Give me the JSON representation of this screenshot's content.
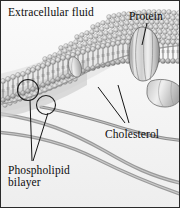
{
  "figure": {
    "background_color": "#fdfdfd",
    "border_color": "#2a2a2a",
    "width": 180,
    "height": 208
  },
  "labels": {
    "extracellular_fluid": "Extracellular fluid",
    "protein": "Protein",
    "cholesterol": "Cholesterol",
    "phospholipid_line1": "Phospholipid",
    "phospholipid_line2": "bilayer"
  },
  "palette": {
    "head_light": "#e3e3e3",
    "head_mid": "#b9b9b9",
    "head_dark": "#8d8d8d",
    "outline": "#4a4a4a",
    "protein_fill": "#dcdcdc",
    "protein_edge": "#6e6e6e",
    "filament": "#8c8c8c",
    "leader_line": "#1a1a1a",
    "circle_marker": "#1f1f1f",
    "text": "#0d0d0d"
  },
  "structures": {
    "bilayer": "two leaflets of spherical phospholipid heads with tail lines between them, sweeping diagonally across the upper half",
    "integral_protein_large": "large lens-shaped transmembrane protein with vertical striations at upper right",
    "integral_protein_small": "small oval protein embedded mid-bilayer",
    "peripheral_protein": "rounded capsule protein at right below the membrane",
    "cholesterol_markers": 2,
    "cytoskeleton_filaments": 3,
    "leader_lines": {
      "protein": 1,
      "cholesterol": 2,
      "phospholipid_bilayer": 2
    }
  }
}
